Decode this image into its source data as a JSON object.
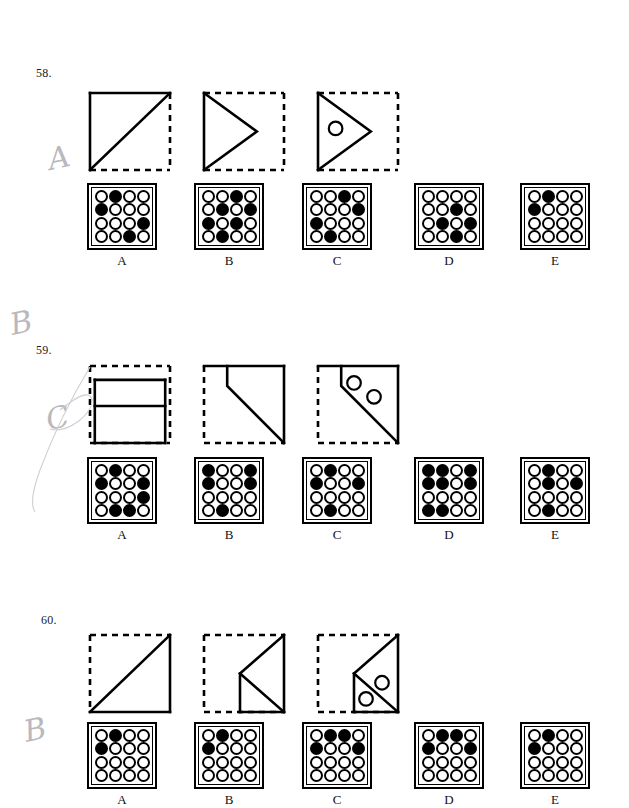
{
  "page": {
    "kind": "printed-test-page",
    "handwritten_marks": [
      {
        "text": "A",
        "x": 48,
        "y": 140
      },
      {
        "text": "B",
        "x": 10,
        "y": 305
      },
      {
        "text": "C",
        "x": 46,
        "y": 400
      },
      {
        "text": "B",
        "x": 24,
        "y": 712
      }
    ]
  },
  "questions": [
    {
      "number": "58.",
      "num_x": 36,
      "num_y": 66,
      "figures": [
        {
          "name": "figure-1",
          "x": 87,
          "y": 90,
          "w": 80,
          "h": 77,
          "solid_edges": [
            "top",
            "left"
          ],
          "dashed_edges": [
            "right",
            "bottom"
          ],
          "diagonal": "bl-tr",
          "circles": []
        },
        {
          "name": "figure-2",
          "x": 201,
          "y": 90,
          "w": 80,
          "h": 77,
          "solid_edges": [
            "left"
          ],
          "dashed_edges": [
            "top",
            "right",
            "bottom"
          ],
          "fold": "left-triangle-right-point",
          "circles": []
        },
        {
          "name": "figure-3",
          "x": 315,
          "y": 90,
          "w": 80,
          "h": 77,
          "solid_edges": [
            "left"
          ],
          "dashed_edges": [
            "top",
            "right",
            "bottom"
          ],
          "fold": "left-triangle-right-point",
          "circles": [
            {
              "cx": 0.22,
              "cy": 0.46,
              "r": 0.085
            }
          ]
        }
      ],
      "options": [
        {
          "label": "A",
          "x": 87,
          "y": 183,
          "w": 70,
          "h": 67,
          "cells": [
            [
              0,
              1,
              0,
              0
            ],
            [
              1,
              0,
              0,
              0
            ],
            [
              0,
              0,
              0,
              1
            ],
            [
              0,
              0,
              1,
              0
            ]
          ]
        },
        {
          "label": "B",
          "x": 194,
          "y": 183,
          "w": 70,
          "h": 67,
          "cells": [
            [
              0,
              0,
              1,
              0
            ],
            [
              0,
              1,
              0,
              1
            ],
            [
              1,
              0,
              1,
              0
            ],
            [
              0,
              1,
              0,
              0
            ]
          ]
        },
        {
          "label": "C",
          "x": 302,
          "y": 183,
          "w": 70,
          "h": 67,
          "cells": [
            [
              0,
              0,
              1,
              0
            ],
            [
              0,
              0,
              0,
              1
            ],
            [
              1,
              0,
              0,
              0
            ],
            [
              0,
              1,
              0,
              0
            ]
          ]
        },
        {
          "label": "D",
          "x": 414,
          "y": 183,
          "w": 70,
          "h": 67,
          "cells": [
            [
              0,
              0,
              0,
              0
            ],
            [
              0,
              0,
              1,
              0
            ],
            [
              0,
              1,
              0,
              1
            ],
            [
              0,
              0,
              1,
              0
            ]
          ]
        },
        {
          "label": "E",
          "x": 520,
          "y": 183,
          "w": 70,
          "h": 67,
          "cells": [
            [
              0,
              1,
              0,
              0
            ],
            [
              1,
              0,
              0,
              0
            ],
            [
              0,
              0,
              0,
              0
            ],
            [
              0,
              0,
              0,
              0
            ]
          ]
        }
      ],
      "label_y": 253
    },
    {
      "number": "59.",
      "num_x": 36,
      "num_y": 343,
      "figures": [
        {
          "name": "figure-1",
          "x": 87,
          "y": 363,
          "w": 80,
          "h": 77,
          "solid_edges": [],
          "dashed_edges": [
            "top",
            "right",
            "left",
            "bottom"
          ],
          "fold": "two-bands",
          "circles": []
        },
        {
          "name": "figure-2",
          "x": 201,
          "y": 363,
          "w": 80,
          "h": 77,
          "solid_edges": [
            "top",
            "right"
          ],
          "dashed_edges": [
            "left",
            "bottom"
          ],
          "fold": "notch-diagonal",
          "circles": []
        },
        {
          "name": "figure-3",
          "x": 315,
          "y": 363,
          "w": 80,
          "h": 77,
          "solid_edges": [
            "top",
            "right"
          ],
          "dashed_edges": [
            "left",
            "bottom"
          ],
          "fold": "notch-diagonal",
          "circles": [
            {
              "cx": 0.45,
              "cy": 0.22,
              "r": 0.085
            },
            {
              "cx": 0.7,
              "cy": 0.4,
              "r": 0.085
            }
          ]
        }
      ],
      "options": [
        {
          "label": "A",
          "x": 87,
          "y": 457,
          "w": 70,
          "h": 67,
          "cells": [
            [
              0,
              1,
              0,
              0
            ],
            [
              1,
              0,
              0,
              1
            ],
            [
              0,
              0,
              0,
              1
            ],
            [
              0,
              1,
              1,
              0
            ]
          ]
        },
        {
          "label": "B",
          "x": 194,
          "y": 457,
          "w": 70,
          "h": 67,
          "cells": [
            [
              1,
              0,
              0,
              1
            ],
            [
              1,
              0,
              0,
              1
            ],
            [
              0,
              0,
              0,
              0
            ],
            [
              0,
              1,
              0,
              0
            ]
          ]
        },
        {
          "label": "C",
          "x": 302,
          "y": 457,
          "w": 70,
          "h": 67,
          "cells": [
            [
              0,
              1,
              0,
              0
            ],
            [
              1,
              0,
              0,
              1
            ],
            [
              0,
              0,
              0,
              0
            ],
            [
              0,
              1,
              0,
              0
            ]
          ]
        },
        {
          "label": "D",
          "x": 414,
          "y": 457,
          "w": 70,
          "h": 67,
          "cells": [
            [
              1,
              1,
              0,
              1
            ],
            [
              1,
              1,
              0,
              1
            ],
            [
              0,
              0,
              0,
              0
            ],
            [
              1,
              1,
              0,
              0
            ]
          ]
        },
        {
          "label": "E",
          "x": 520,
          "y": 457,
          "w": 70,
          "h": 67,
          "cells": [
            [
              0,
              1,
              0,
              0
            ],
            [
              0,
              1,
              0,
              1
            ],
            [
              0,
              0,
              0,
              0
            ],
            [
              0,
              1,
              0,
              0
            ]
          ]
        }
      ],
      "label_y": 527
    },
    {
      "number": "60.",
      "num_x": 41,
      "num_y": 613,
      "figures": [
        {
          "name": "figure-1",
          "x": 87,
          "y": 632,
          "w": 80,
          "h": 77,
          "solid_edges": [
            "bottom",
            "right"
          ],
          "dashed_edges": [
            "top",
            "left"
          ],
          "diagonal": "bl-tr",
          "circles": []
        },
        {
          "name": "figure-2",
          "x": 201,
          "y": 632,
          "w": 80,
          "h": 77,
          "solid_edges": [
            "right"
          ],
          "dashed_edges": [
            "top",
            "left",
            "bottom"
          ],
          "fold": "kite-right",
          "circles": []
        },
        {
          "name": "figure-3",
          "x": 315,
          "y": 632,
          "w": 80,
          "h": 77,
          "solid_edges": [
            "right"
          ],
          "dashed_edges": [
            "top",
            "left",
            "bottom"
          ],
          "fold": "kite-right",
          "circles": [
            {
              "cx": 0.8,
              "cy": 0.62,
              "r": 0.085
            },
            {
              "cx": 0.6,
              "cy": 0.83,
              "r": 0.085
            }
          ]
        }
      ],
      "options": [
        {
          "label": "A",
          "x": 87,
          "y": 722,
          "w": 70,
          "h": 67,
          "cells": [
            [
              0,
              1,
              0,
              0
            ],
            [
              1,
              0,
              0,
              0
            ],
            [
              0,
              0,
              0,
              0
            ],
            [
              0,
              0,
              0,
              0
            ]
          ]
        },
        {
          "label": "B",
          "x": 194,
          "y": 722,
          "w": 70,
          "h": 67,
          "cells": [
            [
              0,
              1,
              0,
              0
            ],
            [
              1,
              0,
              0,
              0
            ],
            [
              0,
              0,
              0,
              0
            ],
            [
              0,
              0,
              0,
              0
            ]
          ]
        },
        {
          "label": "C",
          "x": 302,
          "y": 722,
          "w": 70,
          "h": 67,
          "cells": [
            [
              0,
              1,
              1,
              0
            ],
            [
              1,
              0,
              0,
              1
            ],
            [
              0,
              0,
              0,
              0
            ],
            [
              0,
              0,
              0,
              0
            ]
          ]
        },
        {
          "label": "D",
          "x": 414,
          "y": 722,
          "w": 70,
          "h": 67,
          "cells": [
            [
              0,
              1,
              1,
              0
            ],
            [
              1,
              0,
              0,
              1
            ],
            [
              0,
              0,
              0,
              0
            ],
            [
              0,
              0,
              0,
              0
            ]
          ]
        },
        {
          "label": "E",
          "x": 520,
          "y": 722,
          "w": 70,
          "h": 67,
          "cells": [
            [
              0,
              1,
              0,
              0
            ],
            [
              1,
              0,
              0,
              0
            ],
            [
              0,
              0,
              0,
              0
            ],
            [
              0,
              0,
              0,
              0
            ]
          ]
        }
      ],
      "label_y": 792
    }
  ]
}
